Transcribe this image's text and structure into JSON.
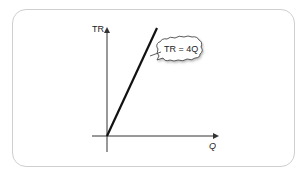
{
  "diagram": {
    "y_axis_label": "TR",
    "x_axis_label": "Q",
    "callout_text": "TR = 4Q",
    "line_color": "#111111",
    "axis_color": "#333333",
    "border_color": "#cfcfcf"
  }
}
